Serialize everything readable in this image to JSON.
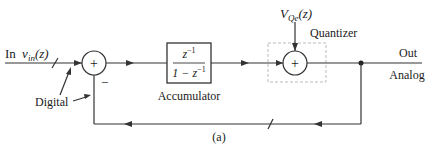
{
  "diagram": {
    "caption": "(a)",
    "input": {
      "prefix": "In",
      "var": "v",
      "sub": "in",
      "arg": "(z)"
    },
    "digital_label": "Digital",
    "sum1": {
      "sign_top": "+",
      "sign_minus": "−"
    },
    "accumulator": {
      "numerator": "z",
      "numerator_sup": "−1",
      "denominator": "1 − z",
      "denominator_sup": "−1",
      "label": "Accumulator"
    },
    "quantizer": {
      "label": "Quantizer",
      "noise_var": "V",
      "noise_sub": "Qe",
      "noise_arg": "(z)",
      "sign": "+"
    },
    "output": {
      "label_top": "Out",
      "label_bottom": "Analog"
    }
  }
}
